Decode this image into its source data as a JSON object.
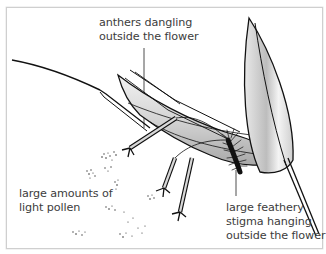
{
  "diagram": {
    "labels": {
      "anthers": {
        "line1": "anthers dangling",
        "line2": "outside the flower"
      },
      "pollen": {
        "line1": "large amounts of",
        "line2": "light pollen"
      },
      "stigma": {
        "line1": "large feathery",
        "line2": "stigma hanging",
        "line3": "outside the flower"
      }
    },
    "icons": [
      "flower-illustration",
      "anther-icon",
      "stigma-icon",
      "pollen-grains"
    ],
    "colors": {
      "border": "#cfcfcf",
      "ink": "#1a1a1a",
      "text": "#3c3c3c",
      "petal_fill": "#d9d9d9",
      "background": "#ffffff"
    }
  }
}
